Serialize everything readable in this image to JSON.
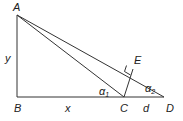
{
  "diagram": {
    "type": "geometry-triangle",
    "points": {
      "A": {
        "label": "A",
        "x": 17,
        "y": 15
      },
      "B": {
        "label": "B",
        "x": 17,
        "y": 97
      },
      "C": {
        "label": "C",
        "x": 124,
        "y": 97
      },
      "D": {
        "label": "D",
        "x": 164,
        "y": 97
      },
      "E": {
        "label": "E",
        "x": 133,
        "y": 69
      }
    },
    "segments": [
      {
        "from": "A",
        "to": "B",
        "label": "y"
      },
      {
        "from": "B",
        "to": "C",
        "label": "x"
      },
      {
        "from": "C",
        "to": "D",
        "label": "d"
      },
      {
        "from": "A",
        "to": "C",
        "label": ""
      },
      {
        "from": "A",
        "to": "D",
        "label": ""
      },
      {
        "from": "C",
        "to": "E",
        "label": ""
      }
    ],
    "labels": {
      "A": "A",
      "B": "B",
      "C": "C",
      "D": "D",
      "E": "E",
      "x": "x",
      "y": "y",
      "d": "d",
      "alpha1": "α",
      "alpha1_sub": "1",
      "alpha2": "α",
      "alpha2_sub": "2"
    },
    "right_angle_markers": [
      "B",
      "E"
    ],
    "line_color": "#333333"
  }
}
